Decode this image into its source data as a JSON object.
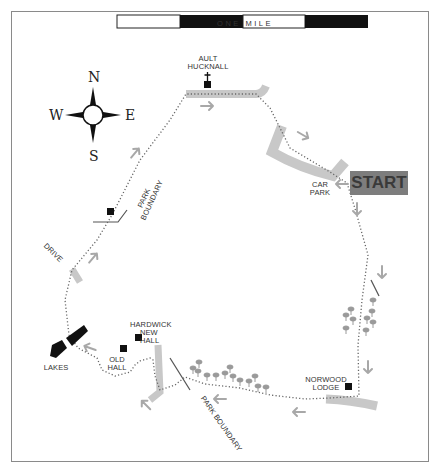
{
  "scale_bar": {
    "caption": "ONE MILE",
    "segments": [
      "white",
      "black",
      "white",
      "black"
    ]
  },
  "compass": {
    "north": "N",
    "south": "S",
    "east": "E",
    "west": "W"
  },
  "start": {
    "label": "START",
    "color": "#7d7d7d"
  },
  "labels": {
    "ault_hucknall_1": "AULT",
    "ault_hucknall_2": "HUCKNALL",
    "car_park_1": "CAR",
    "car_park_2": "PARK",
    "park_boundary_north_1": "PARK",
    "park_boundary_north_2": "BOUNDARY",
    "drive": "DRIVE",
    "hardwick_new_hall_1": "HARDWICK",
    "hardwick_new_hall_2": "NEW",
    "hardwick_new_hall_3": "HALL",
    "old_hall_1": "OLD",
    "old_hall_2": "HALL",
    "lakes": "LAKES",
    "norwood_lodge_1": "NORWOOD",
    "norwood_lodge_2": "LODGE",
    "park_boundary_south": "PARK BOUNDARY"
  },
  "colors": {
    "road": "#c8c8c8",
    "route": "#666666",
    "arrow": "#a8a8a8",
    "tree": "#9a9a9a",
    "building": "#111111",
    "frame": "#8a8a8a"
  }
}
